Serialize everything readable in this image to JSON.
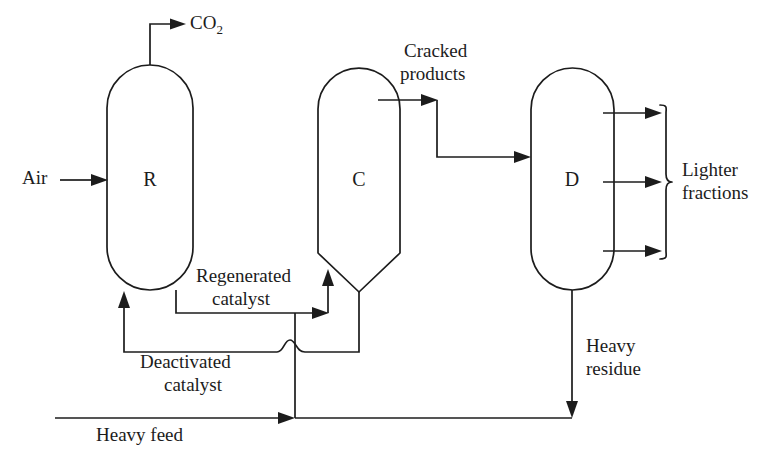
{
  "diagram": {
    "stroke_color": "#1c1c1c",
    "background_color": "#ffffff",
    "width": 776,
    "height": 457,
    "vessels": [
      {
        "id": "R",
        "letter": "R",
        "name": "regenerator-vessel",
        "shape": "stadium"
      },
      {
        "id": "C",
        "letter": "C",
        "name": "cracker-vessel",
        "shape": "rounded-top-conical-bottom"
      },
      {
        "id": "D",
        "letter": "D",
        "name": "distillation-vessel",
        "shape": "stadium"
      }
    ],
    "labels": {
      "co2": "CO",
      "co2_subscript": "2",
      "air": "Air",
      "cracked_products_line1": "Cracked",
      "cracked_products_line2": "products",
      "lighter_fractions_line1": "Lighter",
      "lighter_fractions_line2": "fractions",
      "regenerated_catalyst_line1": "Regenerated",
      "regenerated_catalyst_line2": "catalyst",
      "deactivated_catalyst_line1": "Deactivated",
      "deactivated_catalyst_line2": "catalyst",
      "heavy_residue_line1": "Heavy",
      "heavy_residue_line2": "residue",
      "heavy_feed": "Heavy feed"
    },
    "streams": [
      {
        "name": "air-inlet",
        "from": "external",
        "to": "R"
      },
      {
        "name": "co2-outlet",
        "from": "R",
        "to": "external"
      },
      {
        "name": "regenerated-catalyst",
        "from": "R",
        "to": "C"
      },
      {
        "name": "deactivated-catalyst",
        "from": "C",
        "to": "R"
      },
      {
        "name": "cracked-products",
        "from": "C",
        "to": "D"
      },
      {
        "name": "lighter-fractions",
        "from": "D",
        "to": "external"
      },
      {
        "name": "heavy-residue",
        "from": "D",
        "to": "external"
      },
      {
        "name": "heavy-feed",
        "from": "external",
        "to": "C"
      }
    ]
  }
}
